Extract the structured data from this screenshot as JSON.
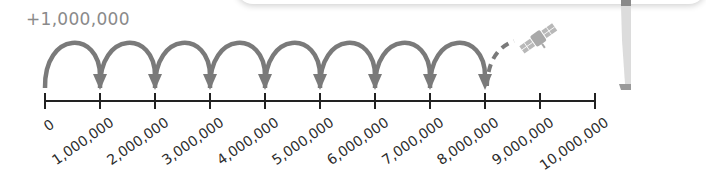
{
  "diagram": {
    "type": "number-line-jumps",
    "jump_label": "+1,000,000",
    "ticks": [
      {
        "value": 0,
        "label": "0"
      },
      {
        "value": 1000000,
        "label": "1,000,000"
      },
      {
        "value": 2000000,
        "label": "2,000,000"
      },
      {
        "value": 3000000,
        "label": "3,000,000"
      },
      {
        "value": 4000000,
        "label": "4,000,000"
      },
      {
        "value": 5000000,
        "label": "5,000,000"
      },
      {
        "value": 6000000,
        "label": "6,000,000"
      },
      {
        "value": 7000000,
        "label": "7,000,000"
      },
      {
        "value": 8000000,
        "label": "8,000,000"
      },
      {
        "value": 9000000,
        "label": "9,000,000"
      },
      {
        "value": 10000000,
        "label": "10,000,000"
      }
    ],
    "solid_jumps": 8,
    "dashed_path_to": "satellite-icon",
    "icons": [
      "satellite-icon",
      "person-figure"
    ],
    "colors": {
      "arc": "#7a7a7a",
      "axis": "#222222",
      "label": "#2c2c2c",
      "jump_label": "#8a8a8a",
      "satellite": "#b5b5b5"
    }
  }
}
